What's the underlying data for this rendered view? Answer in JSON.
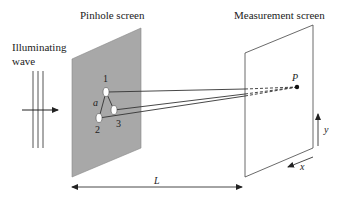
{
  "labels": {
    "illuminating_line1": "Illuminating",
    "illuminating_line2": "wave",
    "pinhole_screen": "Pinhole screen",
    "measurement_screen": "Measurement screen",
    "pinhole_1": "1",
    "pinhole_2": "2",
    "pinhole_3": "3",
    "spacing": "a",
    "point": "P",
    "distance": "L",
    "axis_x": "x",
    "axis_y": "y"
  },
  "colors": {
    "pinhole_screen_fill": "#a8a8a8",
    "line": "#333333",
    "pinhole_fill": "#ffffff"
  }
}
